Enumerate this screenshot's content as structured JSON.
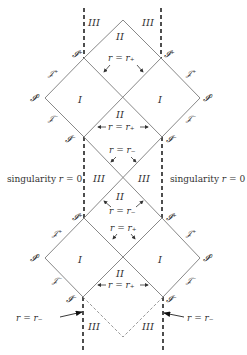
{
  "diagram": {
    "colors": {
      "line": "#888888",
      "dash": "#222222",
      "dotted": "#999999",
      "text": "#333333"
    },
    "regions": {
      "I": "I",
      "II": "II",
      "III": "III"
    },
    "labels": {
      "i_plus": "𝓘⁺",
      "i_minus": "𝓘⁻",
      "i_zero": "𝓘⁰",
      "scri_plus": "𝒥⁺",
      "scri_minus": "𝒥⁻",
      "r_plus": "r = r₊",
      "r_minus": "r = r₋",
      "singularity": "singularity r = 0"
    }
  }
}
